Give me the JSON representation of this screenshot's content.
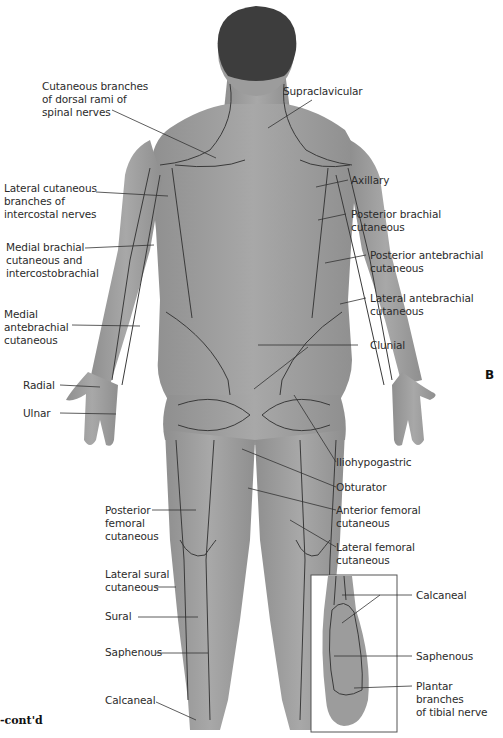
{
  "figure": {
    "panel_letter": "B",
    "caption_fragment": "-cont'd",
    "view": "posterior",
    "colors": {
      "skin": "#9a9a9a",
      "skin_light": "#b4b4b4",
      "hair": "#3d3d3d",
      "nerve_line": "#3a3a3a",
      "leader_line": "#333333"
    }
  },
  "labels_left": [
    {
      "id": "dorsal-rami",
      "text": "Cutaneous branches\nof dorsal rami of\nspinal nerves"
    },
    {
      "id": "lateral-intercostal",
      "text": "Lateral cutaneous\nbranches of\nintercostal nerves"
    },
    {
      "id": "medial-brachial",
      "text": "Medial brachial\ncutaneous and\nintercostobrachial"
    },
    {
      "id": "medial-antebrachial",
      "text": "Medial\nantebrachial\ncutaneous"
    },
    {
      "id": "radial",
      "text": "Radial"
    },
    {
      "id": "ulnar",
      "text": "Ulnar"
    },
    {
      "id": "posterior-femoral",
      "text": "Posterior\nfemoral\ncutaneous"
    },
    {
      "id": "lateral-sural",
      "text": "Lateral sural\ncutaneous"
    },
    {
      "id": "sural",
      "text": "Sural"
    },
    {
      "id": "saphenous-leg",
      "text": "Saphenous"
    },
    {
      "id": "calcaneal-leg",
      "text": "Calcaneal"
    }
  ],
  "labels_right": [
    {
      "id": "supraclavicular",
      "text": "Supraclavicular"
    },
    {
      "id": "axillary",
      "text": "Axillary"
    },
    {
      "id": "posterior-brachial",
      "text": "Posterior brachial\ncutaneous"
    },
    {
      "id": "posterior-antebrachial",
      "text": "Posterior antebrachial\ncutaneous"
    },
    {
      "id": "lateral-antebrachial",
      "text": "Lateral antebrachial\ncutaneous"
    },
    {
      "id": "clunial",
      "text": "Clunial"
    },
    {
      "id": "iliohypogastric",
      "text": "Iliohypogastric"
    },
    {
      "id": "obturator",
      "text": "Obturator"
    },
    {
      "id": "anterior-femoral",
      "text": "Anterior femoral\ncutaneous"
    },
    {
      "id": "lateral-femoral",
      "text": "Lateral femoral\ncutaneous"
    }
  ],
  "inset_labels": [
    {
      "id": "calcaneal-foot",
      "text": "Calcaneal"
    },
    {
      "id": "saphenous-foot",
      "text": "Saphenous"
    },
    {
      "id": "plantar-tibial",
      "text": "Plantar branches\nof tibial nerve"
    }
  ]
}
